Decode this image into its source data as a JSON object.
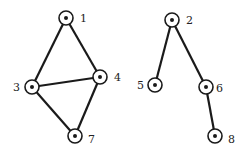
{
  "diagram": {
    "type": "undirected-graph",
    "nodes": [
      {
        "id": "1",
        "label": "1",
        "x": 66,
        "y": 18,
        "lx": 80,
        "ly": 22,
        "anchor": "start"
      },
      {
        "id": "4",
        "label": "4",
        "x": 100,
        "y": 77,
        "lx": 114,
        "ly": 81,
        "anchor": "start"
      },
      {
        "id": "3",
        "label": "3",
        "x": 32,
        "y": 87,
        "lx": 20,
        "ly": 91,
        "anchor": "end"
      },
      {
        "id": "7",
        "label": "7",
        "x": 75,
        "y": 136,
        "lx": 88,
        "ly": 143,
        "anchor": "start"
      },
      {
        "id": "2",
        "label": "2",
        "x": 172,
        "y": 20,
        "lx": 186,
        "ly": 24,
        "anchor": "start"
      },
      {
        "id": "5",
        "label": "5",
        "x": 155,
        "y": 85,
        "lx": 144,
        "ly": 89,
        "anchor": "end"
      },
      {
        "id": "6",
        "label": "6",
        "x": 206,
        "y": 87,
        "lx": 216,
        "ly": 92,
        "anchor": "start"
      },
      {
        "id": "8",
        "label": "8",
        "x": 215,
        "y": 136,
        "lx": 228,
        "ly": 143,
        "anchor": "start"
      }
    ],
    "edges": [
      [
        "1",
        "3"
      ],
      [
        "1",
        "4"
      ],
      [
        "3",
        "4"
      ],
      [
        "3",
        "7"
      ],
      [
        "4",
        "7"
      ],
      [
        "2",
        "5"
      ],
      [
        "2",
        "6"
      ],
      [
        "6",
        "8"
      ]
    ],
    "colors": {
      "stroke": "#1a1a1a",
      "fill": "#ffffff"
    }
  }
}
